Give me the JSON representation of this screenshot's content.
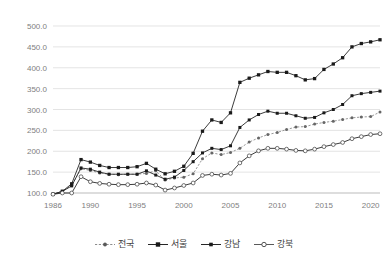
{
  "chart_data": {
    "type": "line",
    "title": "",
    "subtitle": "",
    "xlabel": "",
    "ylabel": "",
    "xlim": [
      1986,
      2021
    ],
    "ylim": [
      100.0,
      500.0
    ],
    "grid": true,
    "legend_position": "bottom",
    "x_tick_labels": [
      "1986",
      "1990",
      "1995",
      "2000",
      "2005",
      "2010",
      "2015",
      "2020"
    ],
    "x_tick_values": [
      1986,
      1990,
      1995,
      2000,
      2005,
      2010,
      2015,
      2020
    ],
    "y_tick_labels": [
      "100.0",
      "150.0",
      "200.0",
      "250.0",
      "300.0",
      "350.0",
      "400.0",
      "450.0",
      "500.0"
    ],
    "y_tick_values": [
      100.0,
      150.0,
      200.0,
      250.0,
      300.0,
      350.0,
      400.0,
      450.0,
      500.0
    ],
    "x": [
      1986,
      1987,
      1988,
      1989,
      1990,
      1991,
      1992,
      1993,
      1994,
      1995,
      1996,
      1997,
      1998,
      1999,
      2000,
      2001,
      2002,
      2003,
      2004,
      2005,
      2006,
      2007,
      2008,
      2009,
      2010,
      2011,
      2012,
      2013,
      2014,
      2015,
      2016,
      2017,
      2018,
      2019,
      2020,
      2021
    ],
    "series": [
      {
        "name": "전국",
        "marker": "small-dot",
        "line_style": "dotted",
        "color": "#8c8c8c",
        "values": [
          97,
          103,
          118,
          158,
          154,
          148,
          145,
          144,
          145,
          145,
          147,
          153,
          131,
          136,
          138,
          146,
          182,
          196,
          192,
          197,
          207,
          222,
          232,
          240,
          245,
          252,
          258,
          259,
          265,
          269,
          272,
          276,
          280,
          282,
          283,
          294
        ]
      },
      {
        "name": "서울",
        "marker": "filled-square",
        "line_style": "solid",
        "color": "#262626",
        "values": [
          97,
          104,
          122,
          180,
          174,
          166,
          161,
          161,
          161,
          163,
          171,
          157,
          146,
          152,
          164,
          195,
          248,
          275,
          269,
          292,
          365,
          375,
          383,
          391,
          389,
          389,
          381,
          371,
          374,
          396,
          409,
          424,
          450,
          458,
          462,
          467
        ]
      },
      {
        "name": "강남",
        "marker": "filled-square",
        "line_style": "solid",
        "color": "#262626",
        "values": [
          97,
          104,
          117,
          160,
          157,
          150,
          145,
          145,
          145,
          145,
          153,
          143,
          133,
          138,
          154,
          175,
          196,
          207,
          204,
          213,
          257,
          275,
          288,
          296,
          291,
          291,
          285,
          279,
          281,
          292,
          300,
          312,
          333,
          338,
          341,
          344
        ]
      },
      {
        "name": "강북",
        "marker": "open-circle",
        "line_style": "solid",
        "color": "#595959",
        "values": [
          97,
          100,
          100,
          139,
          127,
          123,
          121,
          120,
          120,
          121,
          124,
          119,
          107,
          112,
          118,
          124,
          142,
          145,
          143,
          147,
          172,
          189,
          201,
          207,
          207,
          205,
          202,
          201,
          205,
          211,
          216,
          221,
          230,
          235,
          240,
          242
        ]
      }
    ]
  },
  "legend": {
    "items": [
      {
        "label": "전국",
        "marker": "small-dot-dotted-marker"
      },
      {
        "label": "서울",
        "marker": "filled-square-marker"
      },
      {
        "label": "강남",
        "marker": "filled-square-marker"
      },
      {
        "label": "강북",
        "marker": "open-circle-marker"
      }
    ]
  }
}
